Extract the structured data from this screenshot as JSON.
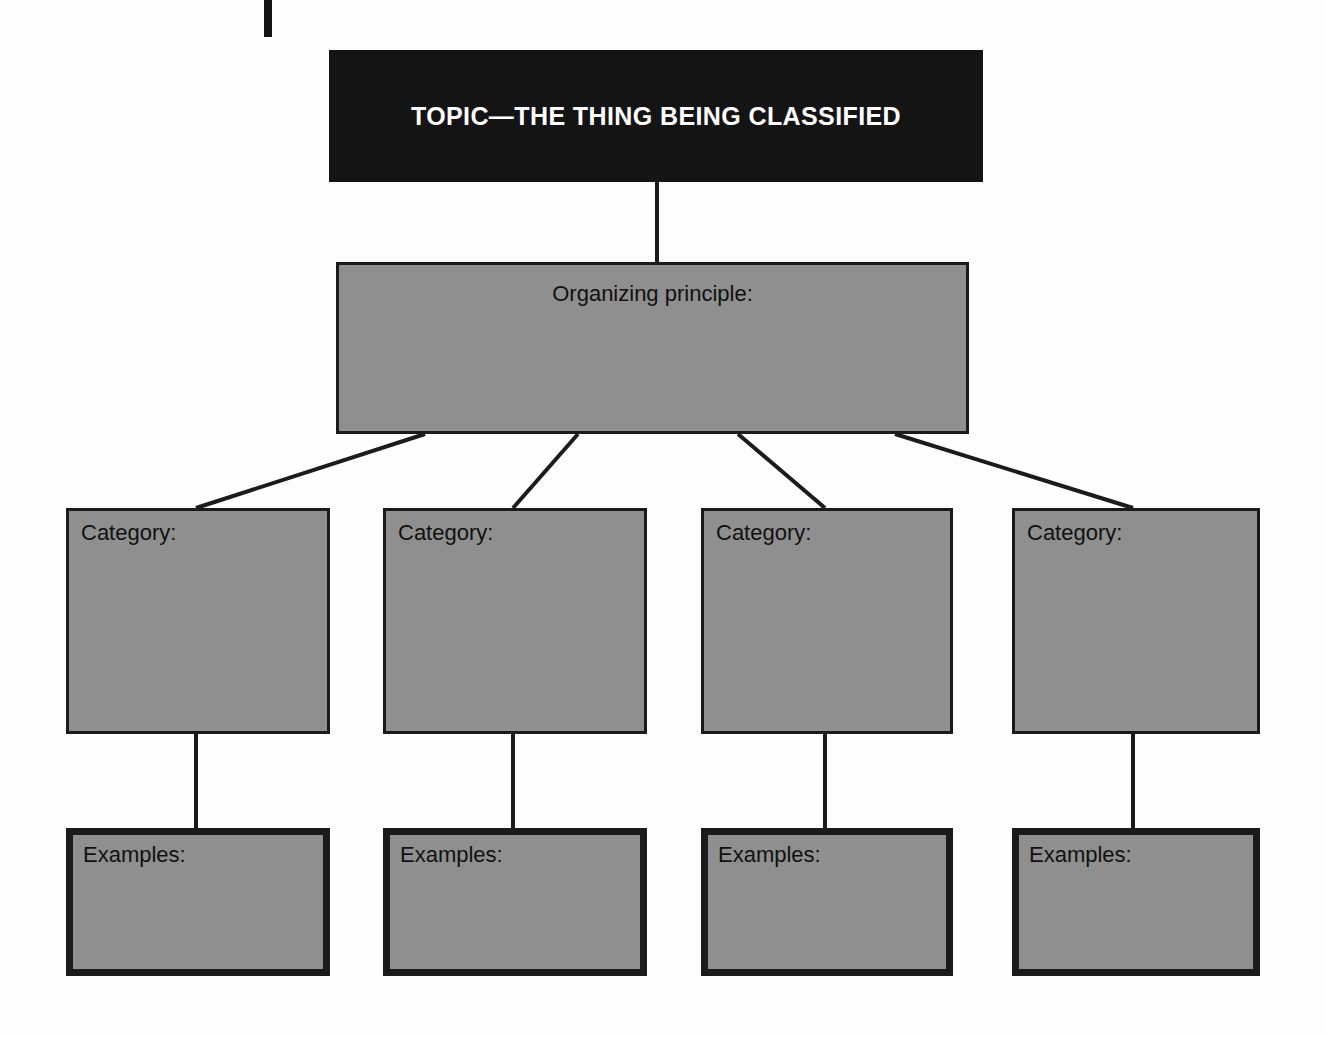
{
  "diagram": {
    "type": "classification-graphic-organizer",
    "topic": {
      "label": "TOPIC—THE THING BEING CLASSIFIED",
      "background_color": "#141414",
      "text_color": "#ffffff"
    },
    "organizing_principle": {
      "label": "Organizing principle:",
      "background_color": "#8f8f8f",
      "border_color": "#1b1b1b"
    },
    "columns": [
      {
        "category": {
          "label": "Category:"
        },
        "examples": {
          "label": "Examples:"
        }
      },
      {
        "category": {
          "label": "Category:"
        },
        "examples": {
          "label": "Examples:"
        }
      },
      {
        "category": {
          "label": "Category:"
        },
        "examples": {
          "label": "Examples:"
        }
      },
      {
        "category": {
          "label": "Category:"
        },
        "examples": {
          "label": "Examples:"
        }
      }
    ],
    "colors": {
      "fill_gray": "#8f8f8f",
      "stroke_dark": "#1b1b1b",
      "page_white": "#fefefe"
    }
  }
}
